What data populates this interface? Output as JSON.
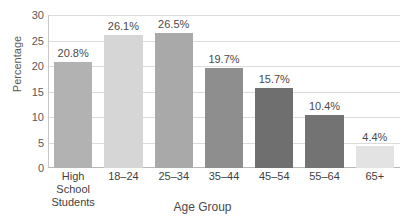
{
  "chart_data": {
    "type": "bar",
    "title": "",
    "xlabel": "Age Group",
    "ylabel": "Percentage",
    "categories": [
      "High School Students",
      "18–24",
      "25–34",
      "35–44",
      "45–54",
      "55–64",
      "65+"
    ],
    "category_lines": [
      [
        "High School",
        "Students"
      ],
      [
        "18–24"
      ],
      [
        "25–34"
      ],
      [
        "35–44"
      ],
      [
        "45–54"
      ],
      [
        "55–64"
      ],
      [
        "65+"
      ]
    ],
    "values": [
      20.8,
      26.1,
      26.5,
      19.7,
      15.7,
      10.4,
      4.4
    ],
    "data_labels": [
      "20.8%",
      "26.1%",
      "26.5%",
      "19.7%",
      "15.7%",
      "10.4%",
      "4.4%"
    ],
    "bar_colors": [
      "#b2b2b2",
      "#d6d6d6",
      "#a9a9a9",
      "#8e8e8e",
      "#6f6f6f",
      "#737373",
      "#e3e3e3"
    ],
    "ylim": [
      0,
      30
    ],
    "yticks": [
      0,
      5,
      10,
      15,
      20,
      25,
      30
    ],
    "ytick_labels": [
      "0",
      "5",
      "10",
      "15",
      "20",
      "25",
      "30"
    ],
    "grid": true,
    "legend": false,
    "gridline_color": "#dcdcdc",
    "axis_color": "#b9b9b9"
  }
}
